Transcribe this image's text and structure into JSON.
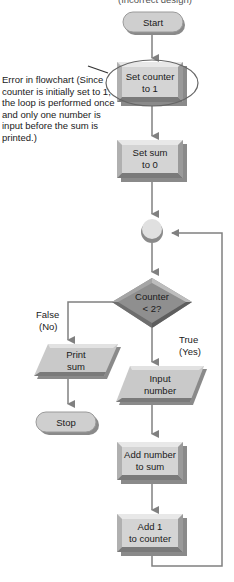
{
  "heading": "(Incorrect design)",
  "annotation": {
    "text": "Error in flowchart (Since counter is initially set to 1, the loop is performed once and only one number is input before the sum is printed.)"
  },
  "nodes": {
    "start": {
      "type": "terminal",
      "lines": [
        "Start"
      ]
    },
    "set_counter": {
      "type": "process",
      "lines": [
        "Set counter",
        "to 1"
      ]
    },
    "set_sum": {
      "type": "process",
      "lines": [
        "Set sum",
        "to 0"
      ]
    },
    "connector": {
      "type": "connector",
      "lines": []
    },
    "decision": {
      "type": "decision",
      "lines": [
        "Counter",
        "< 2?"
      ]
    },
    "print_sum": {
      "type": "io",
      "lines": [
        "Print",
        "sum"
      ]
    },
    "stop": {
      "type": "terminal",
      "lines": [
        "Stop"
      ]
    },
    "input_number": {
      "type": "io",
      "lines": [
        "Input",
        "number"
      ]
    },
    "add_number": {
      "type": "process",
      "lines": [
        "Add number",
        "to sum"
      ]
    },
    "add_counter": {
      "type": "process",
      "lines": [
        "Add 1",
        "to counter"
      ]
    }
  },
  "branch_labels": {
    "false": [
      "False",
      "(No)"
    ],
    "true": [
      "True",
      "(Yes)"
    ]
  },
  "colors": {
    "shape_fill": "#d3d3d3",
    "shape_dark": "#8a8a8a",
    "decision_fill": "#8f8f8f",
    "arrow": "#808080",
    "ellipse": "#666666"
  }
}
